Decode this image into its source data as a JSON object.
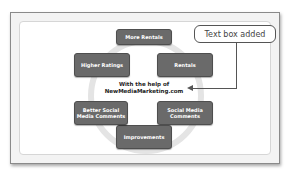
{
  "diagram": {
    "nodes": [
      {
        "label": "More Rentals"
      },
      {
        "label": "Rentals"
      },
      {
        "label": "Social Media Comments"
      },
      {
        "label": "Improvements"
      },
      {
        "label": "Better Social Media Comments"
      },
      {
        "label": "Higher Ratings"
      }
    ],
    "center_line1": "With the help of",
    "center_line2": "NewMediaMarketing.com"
  },
  "callout": {
    "label": "Text box added"
  },
  "colors": {
    "node_fill": "#6a6a6a",
    "node_border": "#4e4e4e",
    "ring": "#e4e4e4"
  }
}
